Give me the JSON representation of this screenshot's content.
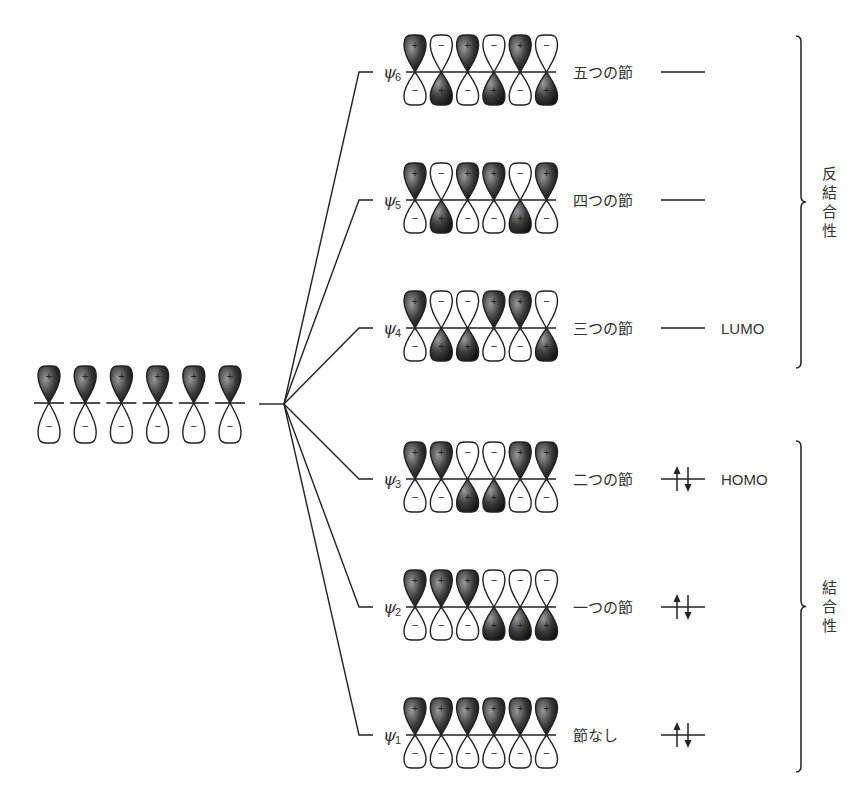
{
  "diagram": {
    "atomic_orbitals": {
      "count": 6,
      "top_sign": "+",
      "bottom_sign": "−"
    },
    "molecular_orbitals": [
      {
        "name": "ψ",
        "sub": "6",
        "top": [
          "+",
          "−",
          "+",
          "−",
          "+",
          "−"
        ],
        "nodes_label": "五つの節",
        "electrons": 0,
        "tag": ""
      },
      {
        "name": "ψ",
        "sub": "5",
        "top": [
          "+",
          "−",
          "+",
          "+",
          "−",
          "+"
        ],
        "nodes_label": "四つの節",
        "electrons": 0,
        "tag": ""
      },
      {
        "name": "ψ",
        "sub": "4",
        "top": [
          "+",
          "−",
          "−",
          "+",
          "+",
          "−"
        ],
        "nodes_label": "三つの節",
        "electrons": 0,
        "tag": "LUMO"
      },
      {
        "name": "ψ",
        "sub": "3",
        "top": [
          "+",
          "+",
          "−",
          "−",
          "+",
          "+"
        ],
        "nodes_label": "二つの節",
        "electrons": 2,
        "tag": "HOMO"
      },
      {
        "name": "ψ",
        "sub": "2",
        "top": [
          "+",
          "+",
          "+",
          "−",
          "−",
          "−"
        ],
        "nodes_label": "一つの節",
        "electrons": 2,
        "tag": ""
      },
      {
        "name": "ψ",
        "sub": "1",
        "top": [
          "+",
          "+",
          "+",
          "+",
          "+",
          "+"
        ],
        "nodes_label": "節なし",
        "electrons": 2,
        "tag": ""
      }
    ],
    "brackets": [
      {
        "label": "反結合性",
        "chars": [
          "反",
          "結",
          "合",
          "性"
        ]
      },
      {
        "label": "結合性",
        "chars": [
          "結",
          "合",
          "性"
        ]
      }
    ],
    "colors": {
      "lobe_dark": "#1e1e1e",
      "lobe_light": "#ffffff",
      "line": "#222222"
    }
  }
}
